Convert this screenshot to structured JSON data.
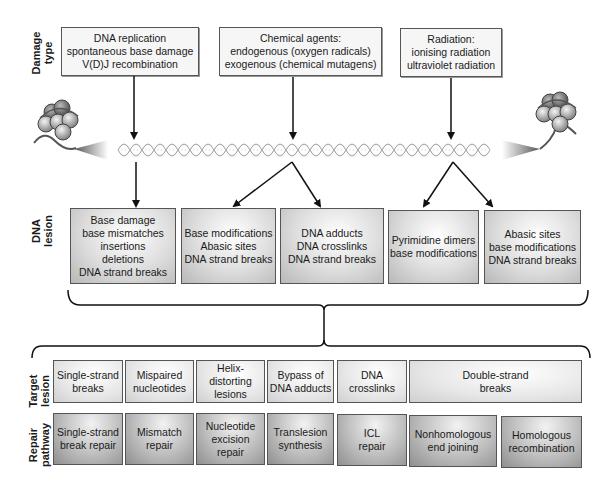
{
  "row_labels": {
    "damage_type": "Damage\ntype",
    "dna_lesion": "DNA\nlesion",
    "target_lesion": "Target\nlesion",
    "repair_pathway": "Repair\npathway"
  },
  "damage_types": [
    {
      "text": "DNA replication\nspontaneous base damage\nV(D)J recombination"
    },
    {
      "text": "Chemical agents:\nendogenous (oxygen radicals)\nexogenous (chemical mutagens)"
    },
    {
      "text": "Radiation:\nionising radiation\nultraviolet radiation"
    }
  ],
  "dna_lesions": [
    {
      "text": "Base damage\nbase mismatches\ninsertions\ndeletions\nDNA strand breaks"
    },
    {
      "text": "Base modifications\nAbasic sites\nDNA strand breaks"
    },
    {
      "text": "DNA adducts\nDNA crosslinks\nDNA strand breaks"
    },
    {
      "text": "Pyrimidine dimers\nbase modifications"
    },
    {
      "text": "Abasic sites\nbase modifications\nDNA strand breaks"
    }
  ],
  "target_lesions": [
    {
      "text": "Single-strand\nbreaks"
    },
    {
      "text": "Mispaired\nnucleotides"
    },
    {
      "text": "Helix-distorting\nlesions"
    },
    {
      "text": "Bypass of\nDNA adducts"
    },
    {
      "text": "DNA\ncrosslinks"
    },
    {
      "text": "Double-strand\nbreaks"
    }
  ],
  "repair_pathways": [
    {
      "text": "Single-strand\nbreak repair"
    },
    {
      "text": "Mismatch\nrepair"
    },
    {
      "text": "Nucleotide\nexcision\nrepair"
    },
    {
      "text": "Translesion\nsynthesis"
    },
    {
      "text": "ICL\nrepair"
    },
    {
      "text": "Nonhomologous\nend joining"
    },
    {
      "text": "Homologous\nrecombination"
    }
  ],
  "icons": {
    "left_chromatin": "nucleosome-icon",
    "right_chromatin": "nucleosome-icon",
    "dna_helix": "dna-double-helix-icon"
  },
  "colors": {
    "line": "#111111",
    "box_border": "#555555",
    "helix": "#9a9a9a"
  }
}
